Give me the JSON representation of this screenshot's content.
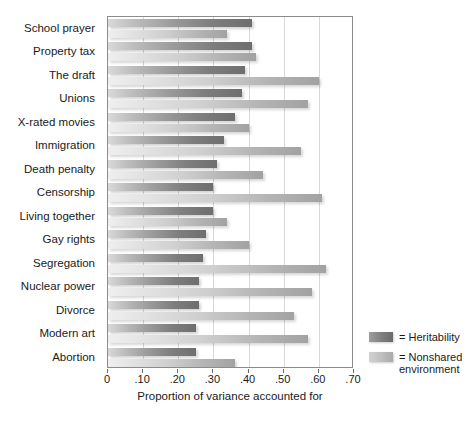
{
  "chart_data": {
    "type": "bar",
    "orientation": "horizontal",
    "title": "",
    "xlabel": "Proportion of variance accounted for",
    "ylabel": "",
    "xlim": [
      0,
      0.7
    ],
    "xticks": [
      "0",
      ".10",
      ".20",
      ".30",
      ".40",
      ".50",
      ".60",
      ".70"
    ],
    "xtick_values": [
      0,
      0.1,
      0.2,
      0.3,
      0.4,
      0.5,
      0.6,
      0.7
    ],
    "grid": "vertical",
    "legend_position": "right-bottom",
    "categories": [
      "School prayer",
      "Property tax",
      "The draft",
      "Unions",
      "X-rated movies",
      "Immigration",
      "Death penalty",
      "Censorship",
      "Living together",
      "Gay rights",
      "Segregation",
      "Nuclear power",
      "Divorce",
      "Modern art",
      "Abortion"
    ],
    "series": [
      {
        "name": "Heritability",
        "color": "#7e7e7e",
        "values": [
          0.41,
          0.41,
          0.39,
          0.38,
          0.36,
          0.33,
          0.31,
          0.3,
          0.3,
          0.28,
          0.27,
          0.26,
          0.26,
          0.25,
          0.25
        ]
      },
      {
        "name": "Nonshared environment",
        "color": "#c0c0c0",
        "values": [
          0.34,
          0.42,
          0.6,
          0.57,
          0.4,
          0.55,
          0.44,
          0.61,
          0.34,
          0.4,
          0.62,
          0.58,
          0.53,
          0.57,
          0.36
        ]
      }
    ]
  },
  "legend": {
    "items": [
      {
        "prefix": "=",
        "label": "Heritability"
      },
      {
        "prefix": "=",
        "label": "Nonshared environment"
      }
    ],
    "heritability_text": "= Heritability",
    "nonshared_line1": "= Nonshared",
    "nonshared_line2": "environment"
  }
}
